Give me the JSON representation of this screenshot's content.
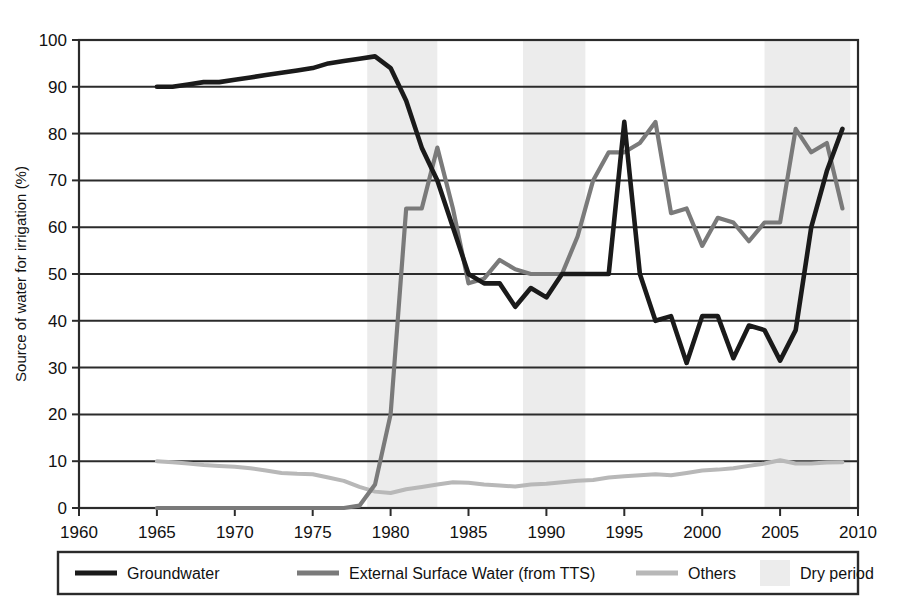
{
  "chart_data": {
    "type": "line",
    "title": "",
    "xlabel": "",
    "ylabel": "Source of water for irrigation (%)",
    "xlim": [
      1960,
      2010
    ],
    "ylim": [
      0,
      100
    ],
    "xticks": [
      1960,
      1965,
      1970,
      1975,
      1980,
      1985,
      1990,
      1995,
      2000,
      2005,
      2010
    ],
    "yticks": [
      0,
      10,
      20,
      30,
      40,
      50,
      60,
      70,
      80,
      90,
      100
    ],
    "grid": true,
    "legend_position": "below",
    "x": [
      1965,
      1966,
      1967,
      1968,
      1969,
      1970,
      1971,
      1972,
      1973,
      1974,
      1975,
      1976,
      1977,
      1978,
      1979,
      1980,
      1981,
      1982,
      1983,
      1984,
      1985,
      1986,
      1987,
      1988,
      1989,
      1990,
      1991,
      1992,
      1993,
      1994,
      1995,
      1996,
      1997,
      1998,
      1999,
      2000,
      2001,
      2002,
      2003,
      2004,
      2005,
      2006,
      2007,
      2008,
      2009
    ],
    "series": [
      {
        "name": "Groundwater",
        "color": "#1a1a1a",
        "values": [
          90,
          90,
          90.5,
          91,
          91,
          91.5,
          92,
          92.5,
          93,
          93.5,
          94,
          95,
          95.5,
          96,
          96.5,
          94,
          87,
          77,
          70,
          60,
          50,
          48,
          48,
          43,
          47,
          45,
          50,
          50,
          50,
          50,
          82.5,
          50,
          40,
          41,
          31,
          41,
          41,
          32,
          39,
          38,
          31.5,
          38,
          60,
          72,
          81
        ],
        "note": "Dominant until 1980, collapses to ~50 by 1985, spike in 1995, fluctuates 31-41 through 2005, then not plotted past 2006"
      },
      {
        "name": "External Surface Water (from TTS)",
        "color": "#7a7a7a",
        "values": [
          0,
          0,
          0,
          0,
          0,
          0,
          0,
          0,
          0,
          0,
          0,
          0,
          0,
          0.5,
          5,
          20,
          64,
          64,
          77,
          64,
          48,
          49,
          53,
          51,
          50,
          50,
          50,
          58,
          70,
          76,
          76,
          78,
          82.5,
          63,
          64,
          56,
          62,
          61,
          57,
          61,
          61,
          81,
          76,
          78,
          64
        ],
        "note": "Rises sharply after 1979, peaks near 82.5 in 1994-1997, dips mid-2000s, ends ~64 in 2009"
      },
      {
        "name": "Others",
        "color": "#b8b8b8",
        "values": [
          10,
          9.8,
          9.5,
          9.2,
          9,
          8.8,
          8.5,
          8,
          7.5,
          7.3,
          7.2,
          6.5,
          5.8,
          4.5,
          3.5,
          3.2,
          4,
          4.5,
          5,
          5.5,
          5.4,
          5,
          4.8,
          4.6,
          5,
          5.2,
          5.5,
          5.8,
          6,
          6.5,
          6.8,
          7,
          7.2,
          7,
          7.5,
          8,
          8.2,
          8.5,
          9,
          9.5,
          10.2,
          9.5,
          9.5,
          9.7,
          9.8
        ],
        "note": "Slowly declines to ~3.5 in 1979 then gradually rises back to ~10"
      }
    ],
    "shaded_regions": {
      "name": "Dry period",
      "color": "#ececec",
      "ranges": [
        [
          1978.5,
          1983.0
        ],
        [
          1988.5,
          1992.5
        ],
        [
          2004.0,
          2009.5
        ]
      ]
    }
  },
  "legend": {
    "items": [
      {
        "label": "Groundwater",
        "color": "#1a1a1a",
        "marker": "line"
      },
      {
        "label": "External Surface Water (from TTS)",
        "color": "#7a7a7a",
        "marker": "line"
      },
      {
        "label": "Others",
        "color": "#b8b8b8",
        "marker": "line"
      },
      {
        "label": "Dry period",
        "color": "#ececec",
        "marker": "swatch"
      }
    ]
  },
  "axes": {
    "y_title": "Source of water for irrigation (%)",
    "y_labels": [
      "100",
      "90",
      "80",
      "70",
      "60",
      "50",
      "40",
      "30",
      "20",
      "10",
      "0"
    ],
    "x_labels": [
      "1960",
      "1965",
      "1970",
      "1975",
      "1980",
      "1985",
      "1990",
      "1995",
      "2000",
      "2005",
      "2010"
    ]
  }
}
